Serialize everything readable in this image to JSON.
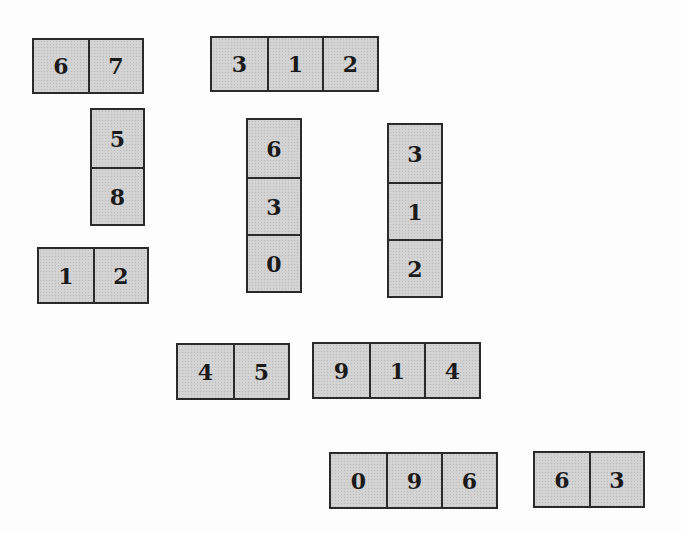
{
  "tiles": [
    {
      "id": "g1",
      "orientation": "horizontal",
      "digits": [
        "6",
        "7"
      ],
      "x": 32,
      "y": 38,
      "cell_w": 54,
      "cell_h": 52
    },
    {
      "id": "g2",
      "orientation": "horizontal",
      "digits": [
        "3",
        "1",
        "2"
      ],
      "x": 210,
      "y": 36,
      "cell_w": 55,
      "cell_h": 52
    },
    {
      "id": "g3",
      "orientation": "vertical",
      "digits": [
        "5",
        "8"
      ],
      "x": 90,
      "y": 108,
      "cell_w": 51,
      "cell_h": 57
    },
    {
      "id": "g4",
      "orientation": "vertical",
      "digits": [
        "6",
        "3",
        "0"
      ],
      "x": 246,
      "y": 118,
      "cell_w": 52,
      "cell_h": 57
    },
    {
      "id": "g5",
      "orientation": "vertical",
      "digits": [
        "3",
        "1",
        "2"
      ],
      "x": 387,
      "y": 123,
      "cell_w": 52,
      "cell_h": 57
    },
    {
      "id": "g6",
      "orientation": "horizontal",
      "digits": [
        "1",
        "2"
      ],
      "x": 37,
      "y": 247,
      "cell_w": 54,
      "cell_h": 53
    },
    {
      "id": "g7",
      "orientation": "horizontal",
      "digits": [
        "4",
        "5"
      ],
      "x": 176,
      "y": 343,
      "cell_w": 55,
      "cell_h": 53
    },
    {
      "id": "g8",
      "orientation": "horizontal",
      "digits": [
        "9",
        "1",
        "4"
      ],
      "x": 312,
      "y": 342,
      "cell_w": 55,
      "cell_h": 53
    },
    {
      "id": "g9",
      "orientation": "horizontal",
      "digits": [
        "0",
        "9",
        "6"
      ],
      "x": 329,
      "y": 452,
      "cell_w": 55,
      "cell_h": 53
    },
    {
      "id": "g10",
      "orientation": "horizontal",
      "digits": [
        "6",
        "3"
      ],
      "x": 533,
      "y": 451,
      "cell_w": 54,
      "cell_h": 53
    }
  ]
}
